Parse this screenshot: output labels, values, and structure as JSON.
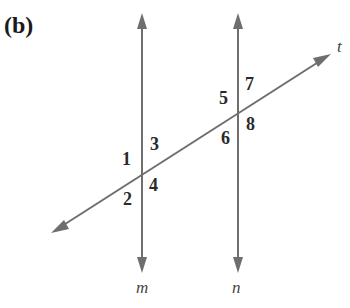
{
  "figure": {
    "panel_label": "(b)",
    "colors": {
      "line": "#6e6e6e",
      "text": "#2a2a2a",
      "background": "#ffffff"
    },
    "lines": {
      "m": {
        "label": "m",
        "x": 142,
        "y_top": 14,
        "y_bottom": 272
      },
      "n": {
        "label": "n",
        "x": 238,
        "y_top": 14,
        "y_bottom": 272
      },
      "t": {
        "label": "t",
        "x1": 52,
        "y1": 233,
        "x2": 330,
        "y2": 55
      }
    },
    "intersections": [
      {
        "lines": [
          "m",
          "t"
        ],
        "x": 142,
        "y": 175
      },
      {
        "lines": [
          "n",
          "t"
        ],
        "x": 238,
        "y": 113
      }
    ],
    "angles": [
      {
        "label": "1",
        "intersection": "m-t",
        "position": "upper-left"
      },
      {
        "label": "3",
        "intersection": "m-t",
        "position": "upper-right"
      },
      {
        "label": "2",
        "intersection": "m-t",
        "position": "lower-left"
      },
      {
        "label": "4",
        "intersection": "m-t",
        "position": "lower-right"
      },
      {
        "label": "5",
        "intersection": "n-t",
        "position": "upper-left"
      },
      {
        "label": "7",
        "intersection": "n-t",
        "position": "upper-right"
      },
      {
        "label": "6",
        "intersection": "n-t",
        "position": "lower-left"
      },
      {
        "label": "8",
        "intersection": "n-t",
        "position": "lower-right"
      }
    ]
  }
}
